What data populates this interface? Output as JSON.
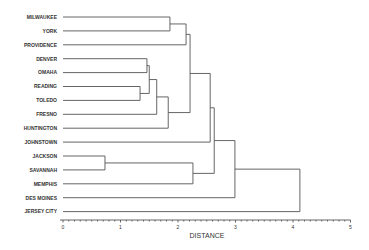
{
  "chart_data": {
    "type": "dendrogram",
    "title": "",
    "xlabel": "DISTANCE",
    "ylabel": "",
    "xlim": [
      0,
      5
    ],
    "xticks": [
      0,
      1,
      2,
      3,
      4,
      5
    ],
    "minor_ticks_per_unit": 10,
    "grid": false,
    "orientation": "horizontal",
    "leaves": [
      "MILWAUKEE",
      "YORK",
      "PROVIDENCE",
      "DENVER",
      "OMAHA",
      "READING",
      "TOLEDO",
      "FRESNO",
      "HUNTINGTON",
      "JOHNSTOWN",
      "JACKSON",
      "SAVANNAH",
      "MEMPHIS",
      "DES MOINES",
      "JERSEY CITY"
    ],
    "merges": [
      {
        "a": "JACKSON",
        "b": "SAVANNAH",
        "distance": 0.73
      },
      {
        "a": "READING",
        "b": "TOLEDO",
        "distance": 1.34
      },
      {
        "a": "DENVER",
        "b": "OMAHA",
        "distance": 1.46
      },
      {
        "a": "DENVER+OMAHA",
        "b": "READING+TOLEDO",
        "distance": 1.5
      },
      {
        "a": "DENVER..TOLEDO",
        "b": "FRESNO",
        "distance": 1.63
      },
      {
        "a": "DENVER..FRESNO",
        "b": "HUNTINGTON",
        "distance": 1.83
      },
      {
        "a": "MILWAUKEE",
        "b": "YORK",
        "distance": 1.86
      },
      {
        "a": "MILWAUKEE+YORK",
        "b": "PROVIDENCE",
        "distance": 2.14
      },
      {
        "a": "MILWAUKEE..PROVIDENCE",
        "b": "DENVER..HUNTINGTON",
        "distance": 2.21
      },
      {
        "a": "JACKSON+SAVANNAH",
        "b": "MEMPHIS",
        "distance": 2.26
      },
      {
        "a": "MILWAUKEE..HUNTINGTON",
        "b": "JOHNSTOWN",
        "distance": 2.56
      },
      {
        "a": "MILWAUKEE..JOHNSTOWN",
        "b": "JACKSON..MEMPHIS",
        "distance": 2.63
      },
      {
        "a": "MILWAUKEE..MEMPHIS",
        "b": "DES MOINES",
        "distance": 2.99
      },
      {
        "a": "MILWAUKEE..DES MOINES",
        "b": "JERSEY CITY",
        "distance": 4.12
      }
    ]
  }
}
